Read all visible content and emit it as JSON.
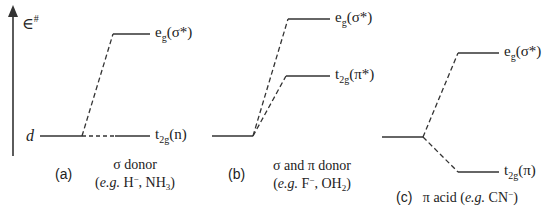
{
  "axis": {
    "label": "∈",
    "label_sup": "#",
    "direction": "up"
  },
  "panels": [
    {
      "id": "a",
      "tag": "(a)",
      "title": "σ donor",
      "example_prefix": "e.g.",
      "example": "H⁻, NH₃",
      "start_label": "d",
      "levels": [
        {
          "name": "e",
          "sub": "g",
          "paren": "(σ*)"
        },
        {
          "name": "t",
          "sub": "2g",
          "paren": "(n)"
        }
      ]
    },
    {
      "id": "b",
      "tag": "(b)",
      "title": "σ and π donor",
      "example_prefix": "e.g.",
      "example": "F⁻, OH₂",
      "levels": [
        {
          "name": "e",
          "sub": "g",
          "paren": "(σ*)"
        },
        {
          "name": "t",
          "sub": "2g",
          "paren": "(π*)"
        }
      ]
    },
    {
      "id": "c",
      "tag": "(c)",
      "title": "π acid",
      "example_prefix": "e.g.",
      "example": "CN⁻",
      "levels": [
        {
          "name": "e",
          "sub": "g",
          "paren": "(σ*)"
        },
        {
          "name": "t",
          "sub": "2g",
          "paren": "(π)"
        }
      ]
    }
  ]
}
